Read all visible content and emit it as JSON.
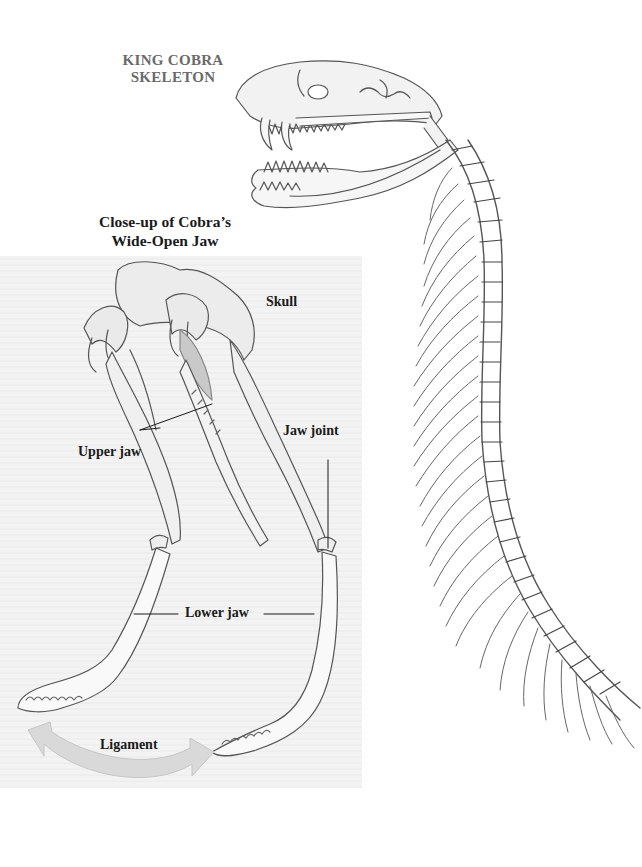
{
  "figure": {
    "main_title": [
      "KING COBRA",
      "SKELETON"
    ],
    "closeup_title": [
      "Close-up of Cobra’s",
      "Wide-Open Jaw"
    ]
  },
  "labels": {
    "skull": "Skull",
    "upper_jaw": "Upper jaw",
    "jaw_joint": "Jaw joint",
    "lower_jaw": "Lower jaw",
    "ligament": "Ligament"
  },
  "colors": {
    "panel_bg": "#f3f3f3",
    "ligament_arrow": "#d8d8d8",
    "line_art": "#555555",
    "title_gray": "#6a6a6a",
    "label_text": "#1a1a1a"
  }
}
